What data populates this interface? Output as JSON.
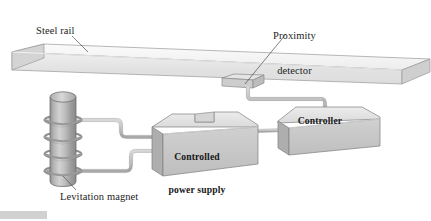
{
  "figure": {
    "type": "technical-line-diagram",
    "background_color": "#ffffff",
    "ink_color": "#1d1d1d"
  },
  "labels": {
    "steel_rail": "Steel rail",
    "proximity_detector_line1": "Proximity",
    "proximity_detector_line2": "detector",
    "levitation_magnet": "Levitation magnet",
    "controlled_power_supply_line1": "Controlled",
    "controlled_power_supply_line2": "power supply",
    "controller": "Controller"
  },
  "components": {
    "steel_rail": {
      "name": "steel-rail",
      "shape": "long 3D rectangular beam",
      "orientation": "slopes slightly downward to the right",
      "fill_top": "#f4f4f4",
      "fill_front": "#e4e4e4",
      "fill_end": "#d2d2d2",
      "stroke": "#8d8d8d"
    },
    "proximity_detector": {
      "name": "proximity-detector",
      "shape": "thin flat 3D wafer block mounted beneath the rail",
      "fill_top": "#e0e0e0",
      "fill_front": "#cccccc",
      "stroke": "#8a8a8a"
    },
    "levitation_magnet": {
      "name": "levitation-magnet",
      "shape": "vertical cylinder with wire coil wound around it",
      "coil_turns": 4,
      "fill_body": "#b6b6b6",
      "fill_top": "#cfcfcf",
      "stroke": "#6f6f6f"
    },
    "controlled_power_supply": {
      "name": "controlled-power-supply",
      "shape": "3D box with rectangular notch cut into top face",
      "fill_top": "#e3e3e3",
      "fill_front": "#c6c6c6",
      "fill_side": "#b0b0b0",
      "stroke": "#7e7e7e"
    },
    "controller": {
      "name": "controller",
      "shape": "3D box",
      "fill_top": "#e3e3e3",
      "fill_front": "#c6c6c6",
      "fill_side": "#b0b0b0",
      "stroke": "#7e7e7e"
    }
  },
  "wires": {
    "color": "#b9b9b9",
    "stroke": "#8f8f8f",
    "connections": [
      "proximity-detector to controller top",
      "controller left face to controlled-power-supply right face",
      "levitation-magnet upper lead to controlled-power-supply left face",
      "levitation-magnet lower lead to controlled-power-supply left face"
    ]
  },
  "leader_lines": [
    "steel-rail label to rail top surface",
    "proximity-detector label to detector block",
    "levitation-magnet label to magnet cylinder"
  ]
}
